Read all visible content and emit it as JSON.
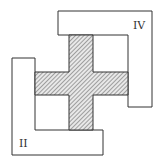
{
  "diagram": {
    "labels": {
      "top_right": "IV",
      "bottom_left": "II"
    },
    "colors": {
      "stroke": "#333333",
      "hatch": "#555555",
      "fill": "#ffffff"
    }
  }
}
